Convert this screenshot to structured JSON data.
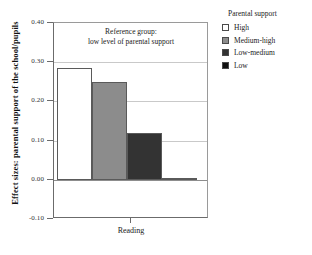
{
  "chart_data": {
    "type": "bar",
    "title": "",
    "xlabel": "",
    "ylabel": "Effect sizes: parental support of the school/pupils",
    "categories": [
      "Reading"
    ],
    "ylim": [
      -0.1,
      0.4
    ],
    "yticks": [
      "0.40",
      "0.30",
      "0.20",
      "0.10",
      "0.00",
      "-0.10"
    ],
    "ytick_values": [
      0.4,
      0.3,
      0.2,
      0.1,
      0.0,
      -0.1
    ],
    "grid": true,
    "legend_position": "right",
    "annotation_line1": "Reference group:",
    "annotation_line2": "low level of parental support",
    "series": [
      {
        "name": "High",
        "values": [
          0.285
        ],
        "color": "#ffffff"
      },
      {
        "name": "Medium-high",
        "values": [
          0.25
        ],
        "color": "#8c8c8c"
      },
      {
        "name": "Low-medium",
        "values": [
          0.12
        ],
        "color": "#333333"
      },
      {
        "name": "Low",
        "values": [
          0.005
        ],
        "color": "#111111"
      }
    ]
  },
  "legend": {
    "title": "Parental support",
    "items": [
      {
        "label": "High",
        "color": "#ffffff"
      },
      {
        "label": "Medium-high",
        "color": "#8c8c8c"
      },
      {
        "label": "Low-medium",
        "color": "#333333"
      },
      {
        "label": "Low",
        "color": "#111111"
      }
    ]
  },
  "axes": {
    "y_title": "Effect sizes: parental support of the school/pupils",
    "x_category": "Reading"
  }
}
